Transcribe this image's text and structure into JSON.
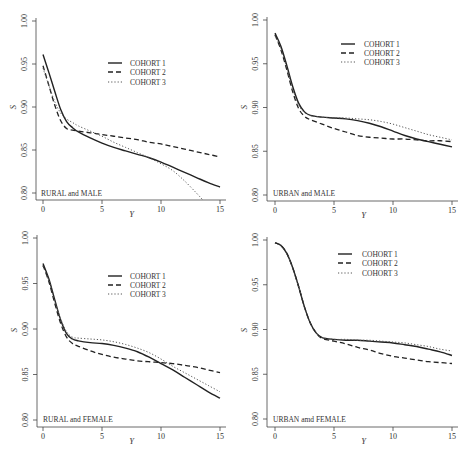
{
  "chart_data": [
    {
      "type": "line",
      "panel": "top-left",
      "title": "",
      "annotation": "RURAL and MALE",
      "xlabel": "Y",
      "ylabel": "S",
      "xlim": [
        0,
        15
      ],
      "ylim": [
        0.8,
        1.0
      ],
      "xticks": [
        0,
        5,
        10,
        15
      ],
      "yticks": [
        "0.80",
        "0.85",
        "0.90",
        "0.95",
        "1.00"
      ],
      "grid": false,
      "legend_position": "upper-center",
      "series": [
        {
          "name": "COHORT 1",
          "style": "solid",
          "x": [
            0,
            0.5,
            1,
            1.5,
            2,
            2.5,
            3,
            4,
            5,
            6,
            7,
            8,
            9,
            10,
            11,
            12,
            13,
            14,
            15
          ],
          "y": [
            0.961,
            0.94,
            0.918,
            0.897,
            0.883,
            0.876,
            0.871,
            0.864,
            0.858,
            0.853,
            0.849,
            0.845,
            0.841,
            0.836,
            0.83,
            0.824,
            0.818,
            0.812,
            0.807
          ]
        },
        {
          "name": "COHORT 2",
          "style": "dashed",
          "x": [
            0,
            0.5,
            1,
            1.5,
            2,
            2.5,
            3,
            4,
            5,
            6,
            7,
            8,
            9,
            10,
            11,
            12,
            13,
            14,
            15
          ],
          "y": [
            0.948,
            0.925,
            0.902,
            0.884,
            0.875,
            0.873,
            0.872,
            0.87,
            0.868,
            0.866,
            0.864,
            0.862,
            0.859,
            0.857,
            0.854,
            0.851,
            0.848,
            0.845,
            0.842
          ]
        },
        {
          "name": "COHORT 3",
          "style": "dotted",
          "x": [
            0,
            0.5,
            1,
            1.5,
            2,
            2.5,
            3,
            4,
            5,
            6,
            7,
            8,
            9,
            10,
            11,
            12,
            13,
            13.6
          ],
          "y": [
            0.945,
            0.925,
            0.906,
            0.893,
            0.886,
            0.882,
            0.878,
            0.872,
            0.866,
            0.859,
            0.853,
            0.847,
            0.841,
            0.834,
            0.826,
            0.814,
            0.8,
            0.791
          ]
        }
      ]
    },
    {
      "type": "line",
      "panel": "top-right",
      "title": "",
      "annotation": "URBAN and MALE",
      "xlabel": "Y",
      "ylabel": "S",
      "xlim": [
        0,
        15
      ],
      "ylim": [
        0.8,
        1.0
      ],
      "xticks": [
        0,
        5,
        10,
        15
      ],
      "yticks": [
        "0.80",
        "0.85",
        "0.90",
        "0.95",
        "1.00"
      ],
      "grid": false,
      "legend_position": "upper-center",
      "series": [
        {
          "name": "COHORT 1",
          "style": "solid",
          "x": [
            0,
            0.5,
            1,
            1.5,
            2,
            2.5,
            3,
            4,
            5,
            6,
            7,
            8,
            9,
            10,
            11,
            12,
            13,
            14,
            15
          ],
          "y": [
            0.985,
            0.97,
            0.948,
            0.924,
            0.905,
            0.895,
            0.891,
            0.889,
            0.888,
            0.887,
            0.885,
            0.882,
            0.878,
            0.873,
            0.868,
            0.864,
            0.861,
            0.858,
            0.855
          ]
        },
        {
          "name": "COHORT 2",
          "style": "dashed",
          "x": [
            0,
            0.5,
            1,
            1.5,
            2,
            2.5,
            3,
            4,
            5,
            6,
            7,
            8,
            9,
            10,
            11,
            12,
            13,
            14,
            15
          ],
          "y": [
            0.983,
            0.966,
            0.943,
            0.918,
            0.899,
            0.89,
            0.886,
            0.881,
            0.876,
            0.872,
            0.868,
            0.866,
            0.865,
            0.864,
            0.864,
            0.863,
            0.862,
            0.862,
            0.861
          ]
        },
        {
          "name": "COHORT 3",
          "style": "dotted",
          "x": [
            0,
            0.5,
            1,
            1.5,
            2,
            2.5,
            3,
            4,
            5,
            6,
            7,
            8,
            9,
            10,
            11,
            12,
            13,
            14,
            15
          ],
          "y": [
            0.982,
            0.967,
            0.945,
            0.921,
            0.903,
            0.894,
            0.891,
            0.889,
            0.888,
            0.888,
            0.887,
            0.886,
            0.884,
            0.881,
            0.877,
            0.873,
            0.869,
            0.866,
            0.863
          ]
        }
      ]
    },
    {
      "type": "line",
      "panel": "bottom-left",
      "title": "",
      "annotation": "RURAL and FEMALE",
      "xlabel": "Y",
      "ylabel": "S",
      "xlim": [
        0,
        15
      ],
      "ylim": [
        0.8,
        1.0
      ],
      "xticks": [
        0,
        5,
        10,
        15
      ],
      "yticks": [
        "0.80",
        "0.85",
        "0.90",
        "0.95",
        "1.00"
      ],
      "grid": false,
      "legend_position": "upper-center",
      "series": [
        {
          "name": "COHORT 1",
          "style": "solid",
          "x": [
            0,
            0.5,
            1,
            1.5,
            2,
            2.5,
            3,
            4,
            5,
            6,
            7,
            8,
            9,
            10,
            11,
            12,
            13,
            14,
            15
          ],
          "y": [
            0.972,
            0.955,
            0.932,
            0.91,
            0.895,
            0.889,
            0.887,
            0.885,
            0.884,
            0.882,
            0.879,
            0.875,
            0.869,
            0.862,
            0.855,
            0.847,
            0.839,
            0.831,
            0.824
          ]
        },
        {
          "name": "COHORT 2",
          "style": "dashed",
          "x": [
            0,
            0.5,
            1,
            1.5,
            2,
            2.5,
            3,
            4,
            5,
            6,
            7,
            8,
            9,
            10,
            11,
            12,
            13,
            14,
            15
          ],
          "y": [
            0.97,
            0.952,
            0.928,
            0.906,
            0.891,
            0.884,
            0.881,
            0.876,
            0.872,
            0.869,
            0.867,
            0.865,
            0.864,
            0.863,
            0.862,
            0.86,
            0.858,
            0.855,
            0.852
          ]
        },
        {
          "name": "COHORT 3",
          "style": "dotted",
          "x": [
            0,
            0.5,
            1,
            1.5,
            2,
            2.5,
            3,
            4,
            5,
            6,
            7,
            8,
            9,
            10,
            11,
            12,
            13,
            14,
            15
          ],
          "y": [
            0.969,
            0.953,
            0.931,
            0.911,
            0.897,
            0.891,
            0.89,
            0.889,
            0.888,
            0.886,
            0.883,
            0.879,
            0.874,
            0.867,
            0.859,
            0.852,
            0.845,
            0.838,
            0.831
          ]
        }
      ]
    },
    {
      "type": "line",
      "panel": "bottom-right",
      "title": "",
      "annotation": "URBAN amd FEMALE",
      "xlabel": "Y",
      "ylabel": "S",
      "xlim": [
        0,
        15
      ],
      "ylim": [
        0.8,
        1.0
      ],
      "xticks": [
        0,
        5,
        10,
        15
      ],
      "yticks": [
        "0.80",
        "0.85",
        "0.90",
        "0.95",
        "1.00"
      ],
      "grid": false,
      "legend_position": "upper-center",
      "series": [
        {
          "name": "COHORT 1",
          "style": "solid",
          "x": [
            0,
            0.5,
            1,
            1.5,
            2,
            2.5,
            3,
            3.5,
            4,
            5,
            6,
            7,
            8,
            9,
            10,
            11,
            12,
            13,
            14,
            15
          ],
          "y": [
            0.997,
            0.994,
            0.985,
            0.969,
            0.948,
            0.925,
            0.907,
            0.896,
            0.891,
            0.889,
            0.888,
            0.888,
            0.887,
            0.886,
            0.885,
            0.883,
            0.881,
            0.878,
            0.875,
            0.871
          ]
        },
        {
          "name": "COHORT 2",
          "style": "dashed",
          "x": [
            0,
            0.5,
            1,
            1.5,
            2,
            2.5,
            3,
            3.5,
            4,
            5,
            6,
            7,
            8,
            9,
            10,
            11,
            12,
            13,
            14,
            15
          ],
          "y": [
            0.997,
            0.994,
            0.985,
            0.969,
            0.948,
            0.925,
            0.907,
            0.896,
            0.89,
            0.887,
            0.884,
            0.88,
            0.877,
            0.873,
            0.87,
            0.868,
            0.866,
            0.864,
            0.863,
            0.862
          ]
        },
        {
          "name": "COHORT 3",
          "style": "dotted",
          "x": [
            0,
            0.5,
            1,
            1.5,
            2,
            2.5,
            3,
            3.5,
            4,
            5,
            6,
            7,
            8,
            9,
            10,
            11,
            12,
            13,
            14,
            15
          ],
          "y": [
            0.997,
            0.994,
            0.985,
            0.969,
            0.948,
            0.925,
            0.907,
            0.896,
            0.891,
            0.889,
            0.889,
            0.888,
            0.888,
            0.887,
            0.886,
            0.885,
            0.883,
            0.881,
            0.878,
            0.876
          ]
        }
      ]
    }
  ],
  "layout": {
    "panels": [
      {
        "axis_x": 36,
        "x0": 43,
        "x15": 220,
        "axis_y": 200,
        "y100": 21,
        "y080": 193,
        "x_right": 226,
        "legend": {
          "line_x1": 108,
          "line_x2": 122,
          "text_x": 130,
          "rows_y": [
            63,
            72,
            82
          ]
        },
        "ylabel_y": 107,
        "xlabel_y": 217,
        "annot_y": 196,
        "annot_x": 41
      },
      {
        "axis_x": 267,
        "x0": 275,
        "x15": 452,
        "axis_y": 201,
        "y100": 20,
        "y080": 195,
        "x_right": 458,
        "legend": {
          "line_x1": 341,
          "line_x2": 355,
          "text_x": 364,
          "rows_y": [
            44,
            53,
            62
          ]
        },
        "ylabel_y": 107,
        "xlabel_y": 218,
        "annot_y": 196,
        "annot_x": 273
      },
      {
        "axis_x": 37,
        "x0": 43,
        "x15": 220,
        "axis_y": 427,
        "y100": 238,
        "y080": 420,
        "x_right": 226,
        "legend": {
          "line_x1": 108,
          "line_x2": 122,
          "text_x": 130,
          "rows_y": [
            276,
            285,
            294
          ]
        },
        "ylabel_y": 330,
        "xlabel_y": 444,
        "annot_y": 422,
        "annot_x": 43
      },
      {
        "axis_x": 267,
        "x0": 275,
        "x15": 452,
        "axis_y": 427,
        "y100": 240,
        "y080": 419,
        "x_right": 458,
        "legend": {
          "line_x1": 338,
          "line_x2": 352,
          "text_x": 362,
          "rows_y": [
            254,
            263,
            273
          ]
        },
        "ylabel_y": 330,
        "xlabel_y": 444,
        "annot_y": 422,
        "annot_x": 273
      }
    ]
  }
}
